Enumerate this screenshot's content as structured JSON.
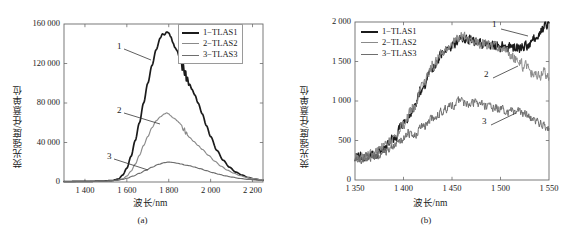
{
  "figure": {
    "background": "#ffffff",
    "line_colors": {
      "series1": "#1b1b1b",
      "series2": "#8a8a8a",
      "series3": "#6e6e6e",
      "axis": "#6b6b6b"
    }
  },
  "panels": [
    {
      "id": "a",
      "caption": "(a)",
      "legend": [
        {
          "label": "1−TLAS1"
        },
        {
          "label": "2−TLAS2"
        },
        {
          "label": "3−TLAS3"
        }
      ],
      "callouts": [
        {
          "label": "1"
        },
        {
          "label": "2"
        },
        {
          "label": "3"
        }
      ]
    },
    {
      "id": "b",
      "caption": "(b)",
      "legend": [
        {
          "label": "1−TLAS1"
        },
        {
          "label": "2−TLAS2"
        },
        {
          "label": "3−TLAS3"
        }
      ],
      "callouts": [
        {
          "label": "1"
        },
        {
          "label": "2"
        },
        {
          "label": "3"
        }
      ]
    }
  ],
  "chart_data": [
    {
      "type": "line",
      "panel": "a",
      "title": "",
      "xlabel": "波长/nm",
      "ylabel": "荧光强度/任意单位",
      "xlim": [
        1300,
        2250
      ],
      "ylim": [
        0,
        160000
      ],
      "xticks": [
        1400,
        1600,
        1800,
        2000,
        2200
      ],
      "xticklabels": [
        "1 400",
        "1 600",
        "1 800",
        "2 000",
        "2 200"
      ],
      "yticks": [
        0,
        40000,
        80000,
        120000,
        160000
      ],
      "yticklabels": [
        "0",
        "40 000",
        "80 000",
        "120 000",
        "160 000"
      ],
      "grid": false,
      "legend_position": "top-right",
      "series": [
        {
          "name": "1−TLAS1",
          "color": "#1b1b1b",
          "x": [
            1300,
            1400,
            1480,
            1530,
            1560,
            1580,
            1600,
            1620,
            1640,
            1660,
            1680,
            1700,
            1720,
            1740,
            1760,
            1770,
            1780,
            1790,
            1800,
            1810,
            1820,
            1830,
            1840,
            1850,
            1860,
            1865,
            1870,
            1875,
            1880,
            1885,
            1890,
            1895,
            1900,
            1910,
            1925,
            1940,
            1960,
            1980,
            2000,
            2030,
            2060,
            2090,
            2120,
            2150,
            2180,
            2210,
            2240
          ],
          "y": [
            500,
            600,
            900,
            1500,
            3000,
            7000,
            14000,
            26000,
            42000,
            60000,
            80000,
            100000,
            118000,
            134000,
            146000,
            150000,
            149000,
            152000,
            151000,
            147000,
            141000,
            136000,
            133000,
            127000,
            122000,
            113000,
            119000,
            108000,
            114000,
            101000,
            106000,
            98000,
            99000,
            94000,
            88000,
            80000,
            69000,
            57000,
            46000,
            32000,
            22000,
            15000,
            10000,
            7000,
            4500,
            3000,
            2000
          ]
        },
        {
          "name": "2−TLAS2",
          "color": "#8a8a8a",
          "x": [
            1300,
            1400,
            1500,
            1550,
            1580,
            1600,
            1620,
            1640,
            1660,
            1680,
            1700,
            1720,
            1740,
            1760,
            1780,
            1790,
            1800,
            1810,
            1820,
            1830,
            1840,
            1850,
            1860,
            1870,
            1875,
            1880,
            1885,
            1890,
            1900,
            1920,
            1940,
            1960,
            1990,
            2020,
            2050,
            2080,
            2110,
            2140,
            2170,
            2200,
            2240
          ],
          "y": [
            400,
            500,
            800,
            1600,
            3200,
            6000,
            11000,
            18000,
            27000,
            37000,
            46000,
            55000,
            62000,
            66000,
            69000,
            70000,
            69000,
            67000,
            65000,
            64000,
            62000,
            60000,
            58000,
            52000,
            55000,
            48000,
            51000,
            47000,
            45000,
            41000,
            37000,
            33000,
            27000,
            21000,
            16000,
            12000,
            9000,
            6500,
            4800,
            3500,
            2400
          ]
        },
        {
          "name": "3−TLAS3",
          "color": "#6e6e6e",
          "x": [
            1300,
            1400,
            1500,
            1550,
            1580,
            1600,
            1630,
            1660,
            1690,
            1720,
            1750,
            1780,
            1800,
            1820,
            1840,
            1860,
            1880,
            1900,
            1920,
            1950,
            1980,
            2010,
            2040,
            2070,
            2100,
            2140,
            2180,
            2240
          ],
          "y": [
            400,
            500,
            900,
            1600,
            2600,
            3800,
            6000,
            8800,
            11800,
            15000,
            17800,
            19600,
            20200,
            19800,
            19000,
            18200,
            17000,
            16500,
            15200,
            13500,
            11500,
            9500,
            7800,
            6200,
            5000,
            3600,
            2600,
            1600
          ]
        }
      ]
    },
    {
      "type": "line",
      "panel": "b",
      "title": "",
      "xlabel": "波长/nm",
      "ylabel": "荧光强度/任意单位",
      "xlim": [
        1350,
        1550
      ],
      "ylim": [
        0,
        2000
      ],
      "xticks": [
        1350,
        1400,
        1450,
        1500,
        1550
      ],
      "xticklabels": [
        "1 350",
        "1 400",
        "1 450",
        "1 500",
        "1 550"
      ],
      "yticks": [
        0,
        500,
        1000,
        1500,
        2000
      ],
      "yticklabels": [
        "0",
        "500",
        "1 000",
        "1 500",
        "2 000"
      ],
      "grid": false,
      "legend_position": "top-left",
      "noisy": true,
      "series": [
        {
          "name": "1−TLAS1",
          "color": "#1b1b1b",
          "noise": 70,
          "x": [
            1350,
            1360,
            1370,
            1380,
            1390,
            1400,
            1410,
            1420,
            1430,
            1440,
            1450,
            1455,
            1460,
            1465,
            1470,
            1480,
            1490,
            1500,
            1510,
            1520,
            1528,
            1535,
            1542,
            1548,
            1550
          ],
          "y": [
            300,
            300,
            320,
            400,
            520,
            700,
            900,
            1180,
            1420,
            1600,
            1700,
            1760,
            1780,
            1790,
            1760,
            1730,
            1710,
            1690,
            1680,
            1670,
            1700,
            1790,
            1900,
            1980,
            2000
          ]
        },
        {
          "name": "2−TLAS2",
          "color": "#8a8a8a",
          "noise": 75,
          "x": [
            1350,
            1360,
            1370,
            1380,
            1390,
            1400,
            1410,
            1420,
            1430,
            1440,
            1450,
            1455,
            1460,
            1465,
            1470,
            1480,
            1490,
            1500,
            1510,
            1518,
            1525,
            1532,
            1540,
            1546,
            1550
          ],
          "y": [
            300,
            290,
            330,
            410,
            530,
            710,
            920,
            1200,
            1440,
            1620,
            1720,
            1790,
            1820,
            1800,
            1770,
            1740,
            1700,
            1660,
            1600,
            1520,
            1440,
            1360,
            1320,
            1350,
            1300
          ]
        },
        {
          "name": "3−TLAS3",
          "color": "#6e6e6e",
          "noise": 62,
          "x": [
            1350,
            1360,
            1370,
            1380,
            1390,
            1400,
            1405,
            1412,
            1420,
            1430,
            1440,
            1450,
            1458,
            1465,
            1472,
            1480,
            1490,
            1500,
            1510,
            1518,
            1525,
            1532,
            1540,
            1546,
            1550
          ],
          "y": [
            260,
            270,
            300,
            360,
            430,
            520,
            600,
            560,
            680,
            780,
            870,
            950,
            1000,
            960,
            990,
            950,
            930,
            900,
            860,
            870,
            840,
            790,
            720,
            680,
            650
          ]
        }
      ]
    }
  ]
}
